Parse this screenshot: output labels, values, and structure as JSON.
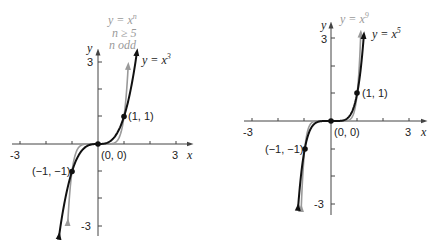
{
  "left_graph": {
    "x_axis_label": "x",
    "y_axis_label": "y",
    "x_tick_labels": [
      "-3",
      "3"
    ],
    "y_tick_labels": [
      "3",
      "-3"
    ],
    "curve_dark_label": "y = x",
    "curve_dark_exp": "3",
    "curve_gray_label_line1": "y = x",
    "curve_gray_label_exp": "n",
    "curve_gray_label_line2": "n ≥ 5",
    "curve_gray_label_line3": "n odd",
    "points": [
      {
        "label": "(1, 1)"
      },
      {
        "label": "(0, 0)"
      },
      {
        "label": "(−1, −1)"
      }
    ]
  },
  "right_graph": {
    "x_axis_label": "x",
    "y_axis_label": "y",
    "x_tick_labels": [
      "-3",
      "3"
    ],
    "y_tick_labels": [
      "3",
      "-3"
    ],
    "curve_dark_label": "y = x",
    "curve_dark_exp": "5",
    "curve_gray_label": "y = x",
    "curve_gray_exp": "9",
    "points": [
      {
        "label": "(1, 1)"
      },
      {
        "label": "(0, 0)"
      },
      {
        "label": "(−1, −1)"
      }
    ]
  },
  "colors": {
    "dark_curve": "#111111",
    "gray_curve": "#9a9a9a",
    "axis": "#444444"
  }
}
